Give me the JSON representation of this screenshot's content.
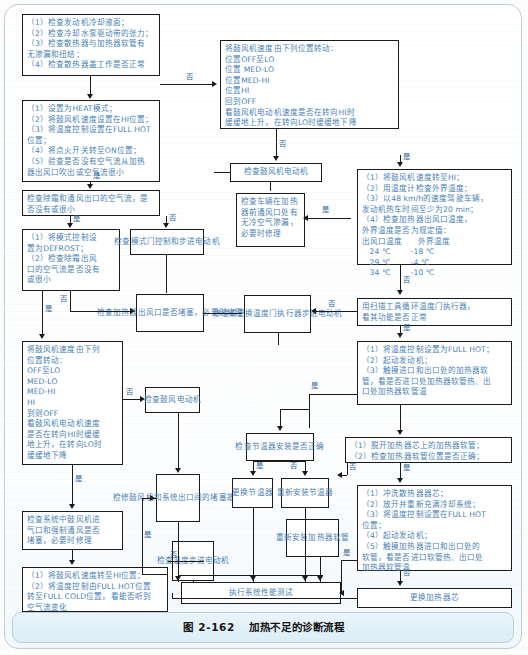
{
  "figure": {
    "number": "图 2-162",
    "title": "加热不足的诊断流程"
  },
  "colors": {
    "box_border": "#1a1a1a",
    "box_text": "#4a7fb5",
    "label_text": "#2d5f95",
    "panel_border": "#b9cfdd",
    "caption_bg": "#dbeef8"
  },
  "labels": {
    "yes": "是",
    "no": "否"
  },
  "boxes": {
    "b1_coolant_check": {
      "lines": [
        "（1）检查发动机冷却液面；",
        "（2）检查冷却水泵驱动带的张力；",
        "（3）检查散热器与加热器软管有",
        "无渗漏和扭结；",
        "（4）检查散热器盖工作是否正常"
      ]
    },
    "b2_heat_mode_setup": {
      "lines": [
        "（1）设置为HEAT模式；",
        "（2）将鼓风机速度设置在HI位置；",
        "（3）将温度控制设置在FULL HOT",
        "位置；",
        "（4）将点火开关转至ON位置；",
        "（5）验查是否没有空气流从加热",
        "器出风口吹出或空气流很小"
      ]
    },
    "b3_defrost_vent_airflow": {
      "lines": [
        "检查除霜和通风出口的空气流，是",
        "否没有或很小"
      ]
    },
    "b4_defrost_mode": {
      "lines": [
        "（1）将模式控制设",
        "置为DEFROST；",
        "（2）检查除霜出风",
        "口的空气流是否没有",
        "或很小"
      ]
    },
    "b5_blower_speed_cycle_left": {
      "lines": [
        "将鼓风机速度由下列",
        "位置转动：",
        "OFF至LO",
        "MED-LO",
        "MED-HI",
        "HI",
        "到则OFF",
        "看鼓风机电动机速度",
        "是否在转向HI时缓缓",
        "地上升，在转向LO时",
        "缓缓地下降"
      ]
    },
    "b6_check_system_blocked": {
      "lines": [
        "检查系统中鼓风机进",
        "气口和强制通风是否",
        "堵塞，必要时修理"
      ]
    },
    "b7_blower_hi_full_cold": {
      "lines": [
        "（1）将鼓风机速度转至HI位置；",
        "（2）将温度控制由FULL HOT位置",
        "转至FULL COLD位置，看能否听到",
        "空气流变化"
      ]
    },
    "b8_mode_door_control": {
      "lines": [
        "检查模式门控制",
        "和步进电动机"
      ]
    },
    "b9_heater_outlet_blocked": {
      "lines": [
        "检查加热器出风",
        "口是否堵塞，必",
        "要时修理"
      ]
    },
    "b10_blower_motor_left": {
      "lines": [
        "检查鼓风",
        "电动机"
      ]
    },
    "b11_repair_blower_blockage": {
      "lines": [
        "检修鼓风",
        "机和系统",
        "出口间的",
        "堵塞故障"
      ]
    },
    "b12_check_temp_stepper_motor": {
      "lines": [
        "检查温",
        "度步进",
        "电动机"
      ]
    },
    "b13_blower_speed_cycle_top": {
      "lines": [
        "将鼓风机速度由下列位置转动：",
        "位置OFF至LO",
        "位置 MED-LO",
        "位置MED-HI",
        "位置HI",
        "回到OFF",
        "看鼓风机电动机速度是否在转向HI时",
        "缓缓地上升，在转向LO时缓缓地下降"
      ]
    },
    "b14_blower_motor_mid": {
      "lines": [
        "检查鼓风机电动机"
      ]
    },
    "b15_cold_air_leak": {
      "lines": [
        "检查车辆在加热",
        "器前通风口处有",
        "无冷空气渗漏，",
        "必要时修理"
      ]
    },
    "b16_repair_replace_temp_door": {
      "lines": [
        "修理或更换温",
        "度门执行器步",
        "进电动机"
      ]
    },
    "b17_check_thermostat_install": {
      "lines": [
        "检查节温器安",
        "装是否正确"
      ]
    },
    "b18_replace_thermostat": {
      "lines": [
        "更换",
        "节温器"
      ]
    },
    "b19_reinstall_thermostat": {
      "lines": [
        "重新安装",
        "节温器"
      ]
    },
    "b20_reinstall_heater_hose": {
      "lines": [
        "重新安装加",
        "热器软管"
      ]
    },
    "b21_blower_hi_outside_temp": {
      "lines": [
        "（1）将鼓风机速度转至HI；",
        "（2）用温度计检查外界温度；",
        "（3）以48 km/h的速度驾驶车辆，",
        "发动机热车时间至少为20 min；",
        "（4）检查加热器出风口温度，",
        "外界温度是否为规定值："
      ],
      "table": {
        "headers": [
          "出风口温度",
          "外界温度"
        ],
        "rows": [
          [
            "24 ℃",
            "-18 ℃"
          ],
          [
            "29 ℃",
            "-4 ℃"
          ],
          [
            "34 ℃",
            "-10 ℃"
          ]
        ]
      }
    },
    "b22_scan_tool_temp_door": {
      "lines": [
        "用扫描工具循环温度门执行器，",
        "看其功能是否正常"
      ]
    },
    "b23_full_hot_touch_hose": {
      "lines": [
        "（1）将温度控制设置为FULL HOT；",
        "（2）起动发动机；",
        "（3）触摸进口和出口处的加热器软",
        "管，看是否进口处加热器软管热、出",
        "口处加热器软管温"
      ]
    },
    "b24_detach_heater_hose": {
      "lines": [
        "（1）脱开加热器芯上的加热器软管；",
        "（2）检查加热器软管位置是否正确；"
      ]
    },
    "b25_flush_heater_core": {
      "lines": [
        "（1）冲洗散热器器芯；",
        "（2）放开并重新充满冷却系统；",
        "（3）将温度控制设置在FULL HOT",
        "位置；",
        "（4）起动发动机；",
        "（5）触摸加热器进口和出口处的",
        "软管，看是否进口软管热、出口处",
        "加热器软管温"
      ]
    },
    "b26_replace_heater_core": {
      "lines": [
        "更换加热器芯"
      ]
    },
    "b27_system_performance_test": {
      "lines": [
        "执行系统性能测试"
      ]
    }
  }
}
